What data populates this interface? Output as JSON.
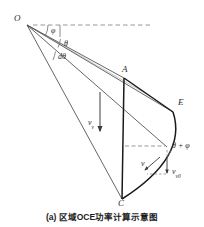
{
  "figure": {
    "caption": "(a) 区域OCE功率计算示意图",
    "type": "geometry-diagram",
    "background_color": "#ffffff",
    "line_color": "#3a3a3a",
    "bold_line_color": "#1a1a1a",
    "dash_color": "#6e6e6e",
    "points": [
      {
        "id": "O",
        "label": "O",
        "x": 27,
        "y": 25
      },
      {
        "id": "A",
        "label": "A",
        "x": 124,
        "y": 78
      },
      {
        "id": "E",
        "label": "E",
        "x": 173,
        "y": 112
      },
      {
        "id": "C",
        "label": "C",
        "x": 122,
        "y": 199
      },
      {
        "id": "P",
        "label": "",
        "x": 167,
        "y": 147
      }
    ],
    "point_labels": [
      {
        "name": "point-label-O",
        "text": "O",
        "x": 14,
        "y": 15
      },
      {
        "name": "point-label-A",
        "text": "A",
        "x": 122,
        "y": 66
      },
      {
        "name": "point-label-E",
        "text": "E",
        "x": 178,
        "y": 99
      },
      {
        "name": "point-label-C",
        "text": "C",
        "x": 118,
        "y": 201
      }
    ],
    "angle_labels": [
      {
        "name": "angle-phi",
        "text": "φ",
        "x": 51,
        "y": 28
      },
      {
        "name": "angle-theta",
        "text": "θ",
        "x": 65,
        "y": 45
      },
      {
        "name": "angle-dtheta",
        "text": "dθ",
        "x": 60,
        "y": 58
      },
      {
        "name": "angle-theta-plus-phi",
        "text": "θ + φ",
        "x": 172,
        "y": 147
      }
    ],
    "velocity_labels": [
      {
        "name": "velocity-vv",
        "base": "v",
        "sub": "v",
        "x": 89,
        "y": 122
      },
      {
        "name": "velocity-v",
        "base": "v",
        "sub": "",
        "x": 142,
        "y": 163
      },
      {
        "name": "velocity-vv0",
        "base": "v",
        "sub": "v0",
        "x": 172,
        "y": 170
      }
    ],
    "dashed_segments": [
      {
        "name": "dashed-horizon-from-O",
        "x1": 33,
        "y1": 25,
        "x2": 150,
        "y2": 25
      },
      {
        "name": "dashed-horizon-at-arcpoint",
        "x1": 125,
        "y1": 146,
        "x2": 166,
        "y2": 146
      }
    ],
    "rays_from_O": [
      {
        "name": "ray-O-to-A",
        "x2": 124,
        "y2": 78
      },
      {
        "name": "ray-O-to-E",
        "x2": 173,
        "y2": 112
      },
      {
        "name": "ray-O-to-P",
        "x2": 167,
        "y2": 147
      },
      {
        "name": "ray-O-to-C",
        "x2": 122,
        "y2": 199
      }
    ],
    "arc": {
      "name": "arc-C-to-E",
      "from": "C",
      "to": "E",
      "control_x": 190,
      "control_y": 150
    },
    "segments": [
      {
        "name": "segment-A-to-C",
        "x1": 124,
        "y1": 78,
        "x2": 122,
        "y2": 199
      },
      {
        "name": "segment-A-to-E",
        "x1": 124,
        "y1": 78,
        "x2": 173,
        "y2": 112
      }
    ],
    "arrows": [
      {
        "name": "arrow-vv-down",
        "x1": 100,
        "y1": 93,
        "x2": 100,
        "y2": 131
      },
      {
        "name": "arrow-vv0-down",
        "x1": 167,
        "y1": 155,
        "x2": 167,
        "y2": 172
      },
      {
        "name": "arrow-v-tangent",
        "x1": 160,
        "y1": 158,
        "x2": 146,
        "y2": 170
      },
      {
        "name": "arrow-vv0-horizontal",
        "x1": 158,
        "y1": 174,
        "x2": 146,
        "y2": 174
      }
    ]
  }
}
